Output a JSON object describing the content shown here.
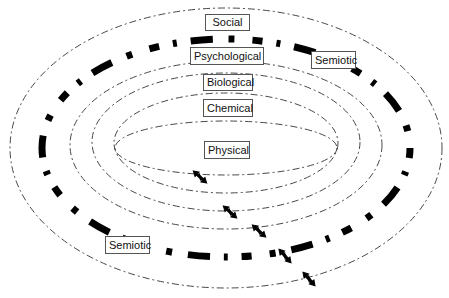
{
  "diagram": {
    "type": "nested-ellipse-levels",
    "levels": [
      {
        "id": "social",
        "label": "Social"
      },
      {
        "id": "psychological",
        "label": "Psychological"
      },
      {
        "id": "biological",
        "label": "Biological"
      },
      {
        "id": "chemical",
        "label": "Chemical"
      },
      {
        "id": "physical",
        "label": "Physical"
      }
    ],
    "semiotic_labels": [
      {
        "id": "semiotic-upper",
        "label": "Semiotic"
      },
      {
        "id": "semiotic-lower",
        "label": "Semiotic"
      }
    ],
    "band": {
      "name": "semiotic-band",
      "style": "thick black dash-dot",
      "color": "#000000"
    },
    "ring_color": "#333333",
    "arrows": {
      "count": 5,
      "glyph": "bidirectional-zigzag-arrow",
      "description": "Arrows crossing each boundary between adjacent levels"
    }
  }
}
